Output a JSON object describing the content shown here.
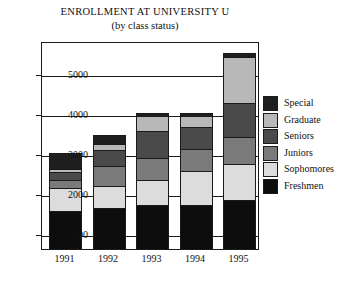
{
  "chart_data": {
    "type": "bar",
    "stacked": true,
    "title": "ENROLLMENT AT UNIVERSITY U",
    "subtitle": "(by class status)",
    "xlabel": "",
    "ylabel": "",
    "categories": [
      "1991",
      "1992",
      "1993",
      "1994",
      "1995"
    ],
    "yticks": [
      1000,
      2000,
      3000,
      4000,
      5000
    ],
    "ylim": [
      625,
      5800
    ],
    "grid": true,
    "legend_position": "right",
    "series": [
      {
        "name": "Freshmen",
        "color": "#0d0d0d",
        "values": [
          975,
          1050,
          1125,
          1130,
          1250
        ]
      },
      {
        "name": "Sophomores",
        "color": "#dcdcdc",
        "values": [
          600,
          575,
          650,
          875,
          925
        ]
      },
      {
        "name": "Juniors",
        "color": "#7a7a7a",
        "values": [
          225,
          525,
          575,
          575,
          700
        ]
      },
      {
        "name": "Seniors",
        "color": "#4a4a4a",
        "values": [
          225,
          425,
          700,
          575,
          875
        ]
      },
      {
        "name": "Graduate",
        "color": "#b8b8b8",
        "values": [
          100,
          175,
          400,
          300,
          1175
        ]
      },
      {
        "name": "Special",
        "color": "#1f1f1f",
        "values": [
          425,
          250,
          100,
          100,
          125
        ]
      }
    ],
    "totals": [
      2550,
      3000,
      3550,
      3555,
      5050
    ]
  },
  "legend": {
    "entries": [
      {
        "label": "Special",
        "color": "#1f1f1f"
      },
      {
        "label": "Graduate",
        "color": "#b8b8b8"
      },
      {
        "label": "Seniors",
        "color": "#4a4a4a"
      },
      {
        "label": "Juniors",
        "color": "#7a7a7a"
      },
      {
        "label": "Sophomores",
        "color": "#dcdcdc"
      },
      {
        "label": "Freshmen",
        "color": "#0d0d0d"
      }
    ]
  },
  "axis": {
    "y_tick_labels": [
      "5000",
      "4000",
      "3000",
      "2000",
      "1000"
    ],
    "x_tick_labels": [
      "1991",
      "1992",
      "1993",
      "1994",
      "1995"
    ]
  }
}
